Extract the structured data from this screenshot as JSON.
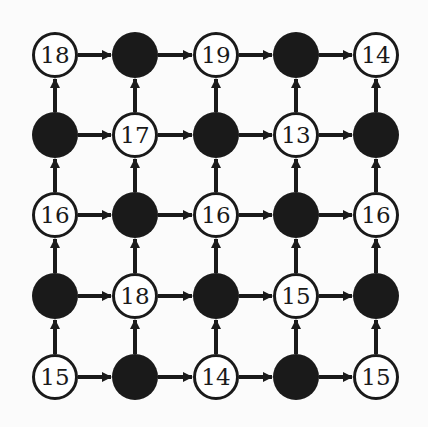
{
  "grid": {
    "cols": [
      55,
      135,
      216,
      296,
      376
    ],
    "rows": [
      55,
      135,
      215,
      296,
      377
    ],
    "radius": 23,
    "colors": {
      "dark": "#1a1a1a",
      "light": "#ffffff",
      "stroke": "#1a1a1a",
      "background": "#fbfbfb"
    },
    "nodes": [
      [
        {
          "t": "18"
        },
        {
          "t": null
        },
        {
          "t": "19"
        },
        {
          "t": null
        },
        {
          "t": "14"
        }
      ],
      [
        {
          "t": null
        },
        {
          "t": "17"
        },
        {
          "t": null
        },
        {
          "t": "13"
        },
        {
          "t": null
        }
      ],
      [
        {
          "t": "16"
        },
        {
          "t": null
        },
        {
          "t": "16"
        },
        {
          "t": null
        },
        {
          "t": "16"
        }
      ],
      [
        {
          "t": null
        },
        {
          "t": "18"
        },
        {
          "t": null
        },
        {
          "t": "15"
        },
        {
          "t": null
        }
      ],
      [
        {
          "t": "15"
        },
        {
          "t": null
        },
        {
          "t": "14"
        },
        {
          "t": null
        },
        {
          "t": "15"
        }
      ]
    ],
    "edges": "each node has an arrow to its right neighbor and an arrow to the node above"
  }
}
